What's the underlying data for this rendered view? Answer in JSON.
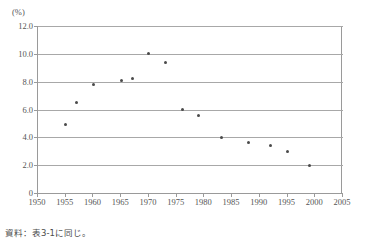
{
  "chart_data": {
    "type": "scatter",
    "title": "",
    "subtitle": "",
    "xlabel": "",
    "ylabel": "",
    "y_unit_label": "(%)",
    "grid": "horizontal",
    "legend": "none",
    "xlim": [
      1950,
      2005
    ],
    "ylim": [
      0,
      12
    ],
    "x_ticks": [
      1950,
      1955,
      1960,
      1965,
      1970,
      1975,
      1980,
      1985,
      1990,
      1995,
      2000,
      2005
    ],
    "x_tick_labels": [
      "1950",
      "1955",
      "1960",
      "1965",
      "1970",
      "1975",
      "1980",
      "1985",
      "1990",
      "1995",
      "2000",
      "2005"
    ],
    "y_ticks": [
      0,
      2,
      4,
      6,
      8,
      10,
      12
    ],
    "y_tick_labels": [
      "0",
      "2.0",
      "4.0",
      "6.0",
      "8.0",
      "10.0",
      "12.0"
    ],
    "marker_color": "#4a4a4a",
    "grid_color": "#a8a8a8",
    "axis_color": "#9a9a9a",
    "points": [
      {
        "x": 1955,
        "y": 4.9
      },
      {
        "x": 1957,
        "y": 6.5
      },
      {
        "x": 1960,
        "y": 7.8
      },
      {
        "x": 1965,
        "y": 8.1
      },
      {
        "x": 1967,
        "y": 8.2
      },
      {
        "x": 1970,
        "y": 10.0
      },
      {
        "x": 1973,
        "y": 9.4
      },
      {
        "x": 1976,
        "y": 6.0
      },
      {
        "x": 1979,
        "y": 5.6
      },
      {
        "x": 1983,
        "y": 4.0
      },
      {
        "x": 1988,
        "y": 3.6
      },
      {
        "x": 1992,
        "y": 3.4
      },
      {
        "x": 1995,
        "y": 3.0
      },
      {
        "x": 1999,
        "y": 2.0
      }
    ]
  },
  "footnote": "資料：表3-1に同じ。"
}
